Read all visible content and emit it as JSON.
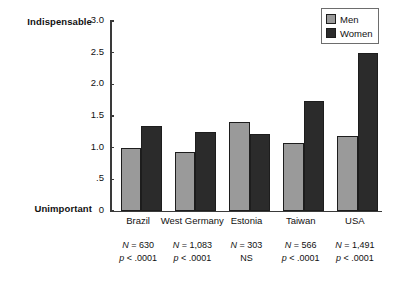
{
  "chart_data": {
    "type": "bar",
    "title": "",
    "xlabel": "",
    "ylabel": "",
    "ylim": [
      0,
      3.0
    ],
    "grid": false,
    "legend_position": "top-right",
    "axis_top_label": "Indispensable",
    "axis_bottom_label": "Unimportant",
    "ytick_labels": [
      "0",
      ".5",
      "1.0",
      "1.5",
      "2.0",
      "2.5",
      "3.0"
    ],
    "ytick_values": [
      0,
      0.5,
      1.0,
      1.5,
      2.0,
      2.5,
      3.0
    ],
    "categories": [
      "Brazil",
      "West Germany",
      "Estonia",
      "Taiwan",
      "USA"
    ],
    "series": [
      {
        "name": "Men",
        "color": "#9a9a9a",
        "values": [
          1.0,
          0.93,
          1.4,
          1.07,
          1.18
        ]
      },
      {
        "name": "Women",
        "color": "#2b2b2b",
        "values": [
          1.35,
          1.24,
          1.22,
          1.73,
          2.5
        ]
      }
    ],
    "annotations": [
      {
        "category": "Brazil",
        "n": "N = 630",
        "p": "p < .0001"
      },
      {
        "category": "West Germany",
        "n": "N = 1,083",
        "p": "p < .0001"
      },
      {
        "category": "Estonia",
        "n": "N = 303",
        "p": "NS"
      },
      {
        "category": "Taiwan",
        "n": "N = 566",
        "p": "p < .0001"
      },
      {
        "category": "USA",
        "n": "N = 1,491",
        "p": "p < .0001"
      }
    ]
  }
}
